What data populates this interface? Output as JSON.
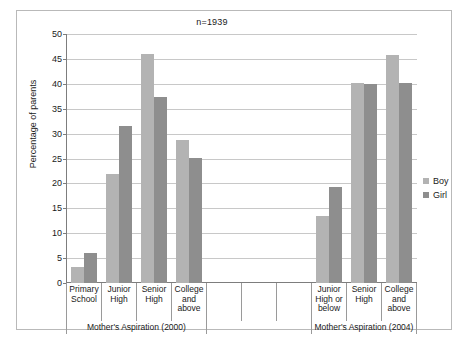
{
  "chart_data": {
    "type": "bar",
    "title": "n=1939",
    "xlabel": "",
    "ylabel": "Percentage of parents",
    "ylim": [
      0,
      50
    ],
    "ystep": 5,
    "grid": true,
    "legend_position": "right",
    "ytick_labels": [
      "50",
      "45",
      "40",
      "35",
      "30",
      "25",
      "20",
      "15",
      "10",
      "5",
      "0"
    ],
    "categories": [
      "Primary School",
      "Junior High",
      "Senior High",
      "College and above",
      "",
      "",
      "",
      "Junior High or below",
      "Senior High",
      "College and above"
    ],
    "category_lines": [
      [
        "Primary",
        "School"
      ],
      [
        "Junior",
        "High"
      ],
      [
        "Senior",
        "High"
      ],
      [
        "College",
        "and",
        "above"
      ],
      [],
      [],
      [],
      [
        "Junior",
        "High or",
        "below"
      ],
      [
        "Senior",
        "High"
      ],
      [
        "College",
        "and",
        "above"
      ]
    ],
    "series": [
      {
        "name": "Boy",
        "color": "#b3b3b3",
        "values": [
          3.2,
          21.9,
          45.9,
          28.7,
          null,
          null,
          null,
          13.5,
          40.1,
          45.8
        ]
      },
      {
        "name": "Girl",
        "color": "#8e8e8e",
        "values": [
          6.0,
          31.5,
          37.3,
          25.2,
          null,
          null,
          null,
          19.3,
          39.9,
          40.2
        ]
      }
    ],
    "group_labels": [
      {
        "text": "Mother's Aspiration (2000)",
        "span": 4
      },
      {
        "text": "",
        "span": 3
      },
      {
        "text": "Mother's Aspiration (2004)",
        "span": 3
      }
    ]
  },
  "legend": {
    "items": [
      {
        "label": "Boy",
        "color": "#b3b3b3"
      },
      {
        "label": "Girl",
        "color": "#8e8e8e"
      }
    ]
  }
}
